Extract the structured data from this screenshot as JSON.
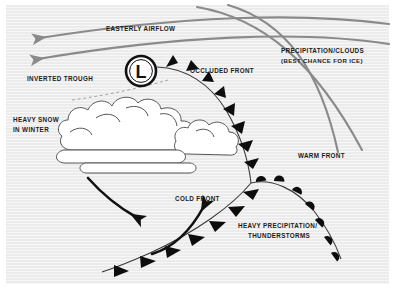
{
  "figure": {
    "kind": "weather-map-diagram",
    "background_color": "#eeeeee",
    "page_color": "#ffffff",
    "ink_color": "#1b1b1b",
    "accent_gray": "#8a8a8a"
  },
  "labels": {
    "easterly_airflow": "EASTERLY AIRFLOW",
    "precipitation_clouds_line1": "PRECIPITATION/CLOUDS",
    "precipitation_clouds_line2": "(BEST CHANCE FOR ICE)",
    "inverted_trough": "INVERTED TROUGH",
    "occluded_front": "OCCLUDED FRONT",
    "heavy_snow_line1": "HEAVY SNOW",
    "heavy_snow_line2": "IN WINTER",
    "warm_front": "WARM FRONT",
    "cold_front": "COLD FRONT",
    "heavy_precip_line1": "HEAVY PRECIPITATION/",
    "heavy_precip_line2": "THUNDERSTORMS",
    "low_pressure_symbol": "L"
  }
}
